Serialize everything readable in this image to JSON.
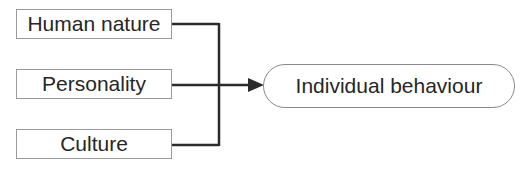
{
  "diagram": {
    "inputs": [
      {
        "label": "Human nature"
      },
      {
        "label": "Personality"
      },
      {
        "label": "Culture"
      }
    ],
    "output": {
      "label": "Individual behaviour"
    },
    "colors": {
      "line": "#2b2b2b",
      "box_border": "#9a9a9a",
      "text": "#262626"
    }
  }
}
